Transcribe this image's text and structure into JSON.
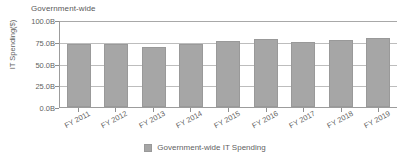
{
  "header": {
    "title": "Government-wide"
  },
  "legend": {
    "position": "bottom",
    "swatch_color": "#a6a6a6",
    "entries": [
      {
        "label": "Government-wide IT Spending",
        "color": "#a6a6a6"
      }
    ]
  },
  "axes": {
    "y_title": "IT Spending($)",
    "y_ticks": [
      "100.0B",
      "75.0B",
      "50.0B",
      "25.0B",
      "0.0B"
    ],
    "x_ticks": [
      "FY 2011",
      "FY 2012",
      "FY 2013",
      "FY 2014",
      "FY 2015",
      "FY 2016",
      "FY 2017",
      "FY 2018",
      "FY 2019"
    ]
  },
  "chart_data": {
    "type": "bar",
    "title": "Government-wide",
    "xlabel": "",
    "ylabel": "IT Spending($)",
    "categories": [
      "FY 2011",
      "FY 2012",
      "FY 2013",
      "FY 2014",
      "FY 2015",
      "FY 2016",
      "FY 2017",
      "FY 2018",
      "FY 2019"
    ],
    "values": [
      73.5,
      73.5,
      70.0,
      73.5,
      77.0,
      79.5,
      76.0,
      78.0,
      80.0
    ],
    "units": "billions of dollars",
    "ylim": [
      0,
      100
    ],
    "y_tick_values": [
      0,
      25,
      50,
      75,
      100
    ],
    "y_tick_labels": [
      "0.0B",
      "25.0B",
      "50.0B",
      "75.0B",
      "100.0B"
    ],
    "grid": true,
    "legend": [
      "Government-wide IT Spending"
    ],
    "legend_position": "bottom",
    "bar_color": "#a6a6a6",
    "series": [
      {
        "name": "Government-wide IT Spending",
        "values": [
          73.5,
          73.5,
          70.0,
          73.5,
          77.0,
          79.5,
          76.0,
          78.0,
          80.0
        ]
      }
    ]
  }
}
